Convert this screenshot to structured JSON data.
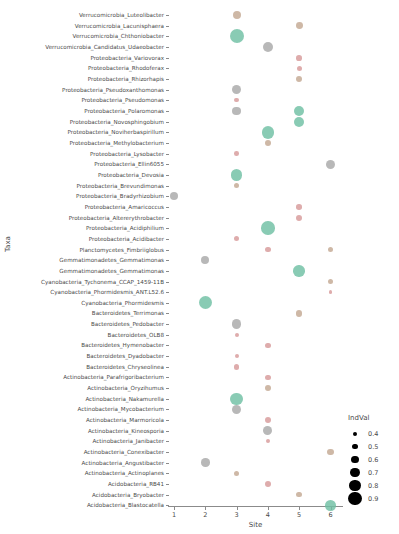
{
  "chart_data": {
    "type": "scatter",
    "title": "",
    "xlabel": "Site",
    "ylabel": "Taxa",
    "x_ticks": [
      "1",
      "2",
      "3",
      "4",
      "5",
      "6"
    ],
    "xlim": [
      0.5,
      6.5
    ],
    "grid": false,
    "legend": {
      "title": "IndVal",
      "position": "right",
      "entries": [
        "0.4",
        "0.5",
        "0.6",
        "0.7",
        "0.8",
        "0.9"
      ],
      "sizes": [
        2.0,
        2.9,
        3.9,
        4.9,
        5.9,
        6.8
      ]
    },
    "colors": {
      "teal": "#6fc0a4",
      "gray": "#a8a8a8",
      "pink": "#d79a9a",
      "tan": "#c3a893"
    },
    "categories": [
      "Verrucomicrobia_Luteolibacter",
      "Verrucomicrobia_Lacunisphaera",
      "Verrucomicrobia_Chthoniobacter",
      "Verrucomicrobia_Candidatus_Udaeobacter",
      "Proteobacteria_Variovorax",
      "Proteobacteria_Rhodoferax",
      "Proteobacteria_Rhizorhapis",
      "Proteobacteria_Pseudoxanthomonas",
      "Proteobacteria_Pseudomonas",
      "Proteobacteria_Polaromonas",
      "Proteobacteria_Novosphingobium",
      "Proteobacteria_Noviherbaspirillum",
      "Proteobacteria_Methylobacterium",
      "Proteobacteria_Lysobacter",
      "Proteobacteria_Ellin6055",
      "Proteobacteria_Devosia",
      "Proteobacteria_Brevundimonas",
      "Proteobacteria_Bradyrhizobium",
      "Proteobacteria_Amaricoccus",
      "Proteobacteria_Altererythrobacter",
      "Proteobacteria_Acidiphilium",
      "Proteobacteria_Acidibacter",
      "Planctomycetes_Fimbriiglobus",
      "Gemmatimonadetes_Gemmatimonas",
      "Gemmatimonadetes_Gemmatimonas",
      "Cyanobacteria_Tychonema_CCAP_1459-11B",
      "Cyanobacteria_Phormidesmis_ANT.L52.6",
      "Cyanobacteria_Phormidesmis",
      "Bacteroidetes_Terrimonas",
      "Bacteroidetes_Pedobacter",
      "Bacteroidetes_OLB8",
      "Bacteroidetes_Hymenobacter",
      "Bacteroidetes_Dyadobacter",
      "Bacteroidetes_Chryseolinea",
      "Actinobacteria_Parafrigoribacterium",
      "Actinobacteria_Oryzihumus",
      "Actinobacteria_Nakamurella",
      "Actinobacteria_Mycobacterium",
      "Actinobacteria_Marmoricola",
      "Actinobacteria_Kineosporia",
      "Actinobacteria_Janibacter",
      "Actinobacteria_Conexibacter",
      "Actinobacteria_Angustibacter",
      "Actinobacteria_Actinoplanes",
      "Acidobacteria_RB41",
      "Acidobacteria_Bryobacter",
      "Acidobacteria_Blastocatella"
    ],
    "points": [
      {
        "taxon": 0,
        "site": 3,
        "indval": 0.55,
        "color": "tan"
      },
      {
        "taxon": 1,
        "site": 5,
        "indval": 0.5,
        "color": "tan"
      },
      {
        "taxon": 2,
        "site": 3,
        "indval": 0.85,
        "color": "teal"
      },
      {
        "taxon": 3,
        "site": 4,
        "indval": 0.65,
        "color": "gray"
      },
      {
        "taxon": 4,
        "site": 5,
        "indval": 0.45,
        "color": "pink"
      },
      {
        "taxon": 5,
        "site": 5,
        "indval": 0.42,
        "color": "pink"
      },
      {
        "taxon": 6,
        "site": 5,
        "indval": 0.48,
        "color": "tan"
      },
      {
        "taxon": 7,
        "site": 3,
        "indval": 0.62,
        "color": "gray"
      },
      {
        "taxon": 8,
        "site": 3,
        "indval": 0.38,
        "color": "pink"
      },
      {
        "taxon": 9,
        "site": 3,
        "indval": 0.58,
        "color": "gray"
      },
      {
        "taxon": 9,
        "site": 5,
        "indval": 0.68,
        "color": "teal"
      },
      {
        "taxon": 10,
        "site": 5,
        "indval": 0.66,
        "color": "teal"
      },
      {
        "taxon": 11,
        "site": 4,
        "indval": 0.78,
        "color": "teal"
      },
      {
        "taxon": 12,
        "site": 4,
        "indval": 0.48,
        "color": "tan"
      },
      {
        "taxon": 13,
        "site": 3,
        "indval": 0.4,
        "color": "pink"
      },
      {
        "taxon": 14,
        "site": 6,
        "indval": 0.62,
        "color": "gray"
      },
      {
        "taxon": 15,
        "site": 3,
        "indval": 0.72,
        "color": "teal"
      },
      {
        "taxon": 16,
        "site": 3,
        "indval": 0.45,
        "color": "tan"
      },
      {
        "taxon": 17,
        "site": 1,
        "indval": 0.58,
        "color": "gray"
      },
      {
        "taxon": 18,
        "site": 5,
        "indval": 0.44,
        "color": "pink"
      },
      {
        "taxon": 19,
        "site": 5,
        "indval": 0.46,
        "color": "pink"
      },
      {
        "taxon": 20,
        "site": 4,
        "indval": 0.82,
        "color": "teal"
      },
      {
        "taxon": 21,
        "site": 3,
        "indval": 0.42,
        "color": "pink"
      },
      {
        "taxon": 22,
        "site": 4,
        "indval": 0.44,
        "color": "pink"
      },
      {
        "taxon": 22,
        "site": 6,
        "indval": 0.42,
        "color": "tan"
      },
      {
        "taxon": 23,
        "site": 2,
        "indval": 0.55,
        "color": "gray"
      },
      {
        "taxon": 24,
        "site": 5,
        "indval": 0.72,
        "color": "teal"
      },
      {
        "taxon": 25,
        "site": 6,
        "indval": 0.44,
        "color": "tan"
      },
      {
        "taxon": 26,
        "site": 6,
        "indval": 0.36,
        "color": "pink"
      },
      {
        "taxon": 27,
        "site": 2,
        "indval": 0.8,
        "color": "teal"
      },
      {
        "taxon": 28,
        "site": 5,
        "indval": 0.48,
        "color": "tan"
      },
      {
        "taxon": 29,
        "site": 3,
        "indval": 0.62,
        "color": "gray"
      },
      {
        "taxon": 30,
        "site": 3,
        "indval": 0.36,
        "color": "pink"
      },
      {
        "taxon": 31,
        "site": 4,
        "indval": 0.45,
        "color": "pink"
      },
      {
        "taxon": 32,
        "site": 3,
        "indval": 0.36,
        "color": "pink"
      },
      {
        "taxon": 33,
        "site": 3,
        "indval": 0.45,
        "color": "pink"
      },
      {
        "taxon": 34,
        "site": 4,
        "indval": 0.44,
        "color": "pink"
      },
      {
        "taxon": 35,
        "site": 4,
        "indval": 0.46,
        "color": "tan"
      },
      {
        "taxon": 36,
        "site": 3,
        "indval": 0.76,
        "color": "teal"
      },
      {
        "taxon": 37,
        "site": 3,
        "indval": 0.62,
        "color": "gray"
      },
      {
        "taxon": 38,
        "site": 4,
        "indval": 0.46,
        "color": "pink"
      },
      {
        "taxon": 39,
        "site": 4,
        "indval": 0.6,
        "color": "gray"
      },
      {
        "taxon": 40,
        "site": 4,
        "indval": 0.36,
        "color": "pink"
      },
      {
        "taxon": 41,
        "site": 6,
        "indval": 0.5,
        "color": "tan"
      },
      {
        "taxon": 42,
        "site": 2,
        "indval": 0.58,
        "color": "gray"
      },
      {
        "taxon": 43,
        "site": 3,
        "indval": 0.45,
        "color": "tan"
      },
      {
        "taxon": 44,
        "site": 4,
        "indval": 0.46,
        "color": "pink"
      },
      {
        "taxon": 45,
        "site": 5,
        "indval": 0.44,
        "color": "tan"
      },
      {
        "taxon": 46,
        "site": 6,
        "indval": 0.68,
        "color": "teal"
      }
    ]
  }
}
